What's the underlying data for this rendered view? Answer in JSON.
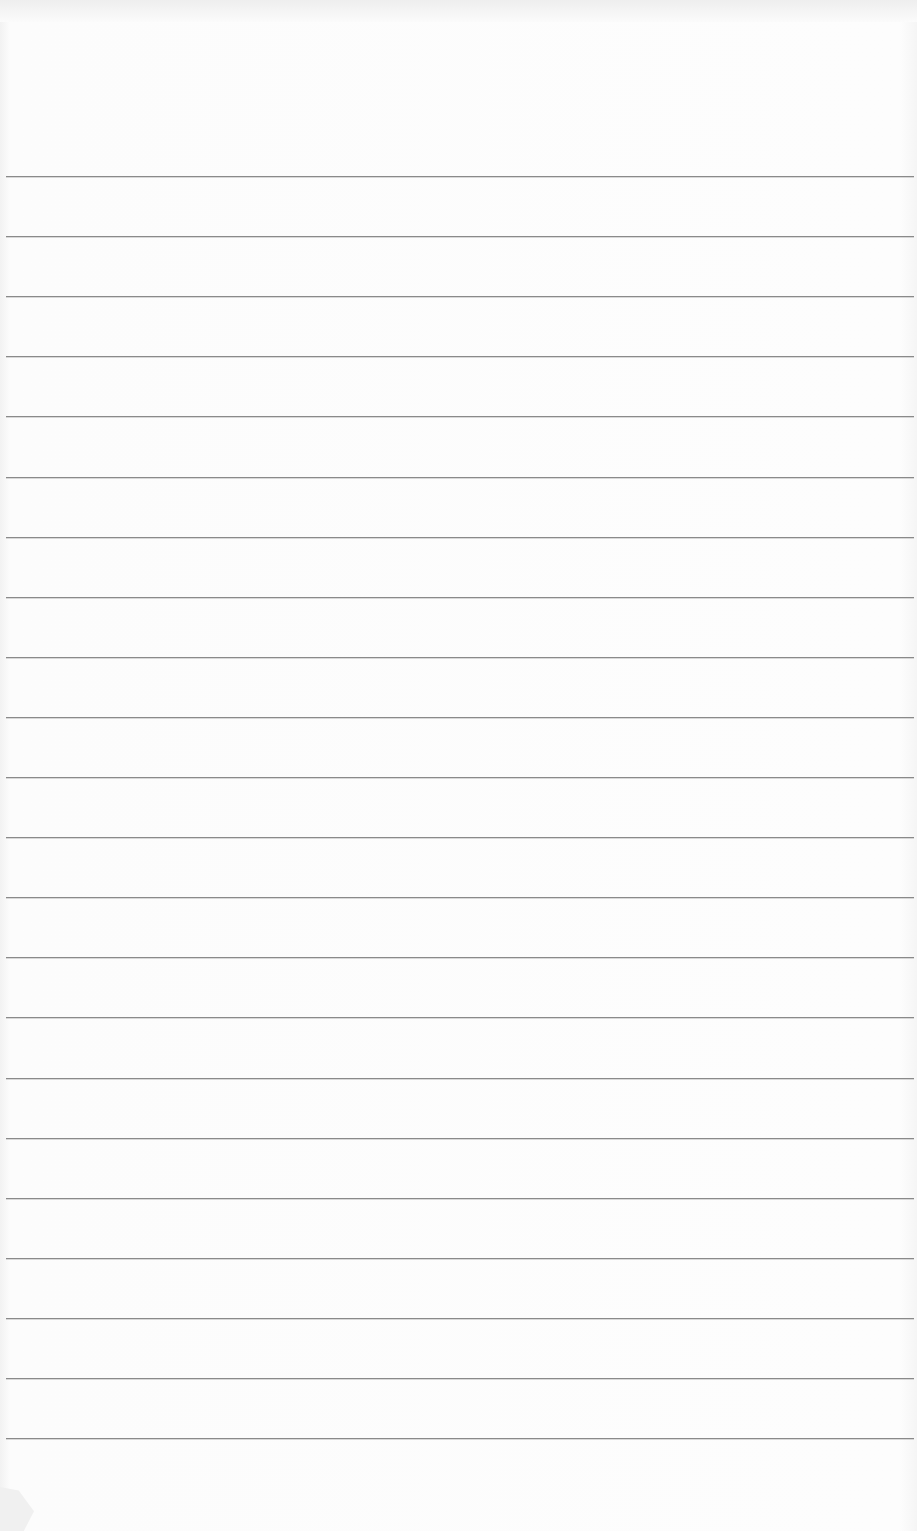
{
  "page": {
    "type": "lined-paper",
    "background_color": "#fbfbfb",
    "rule_color": "#8a8a8a",
    "rule_count": 22,
    "first_rule_y": 176,
    "rule_spacing": 60.1
  }
}
